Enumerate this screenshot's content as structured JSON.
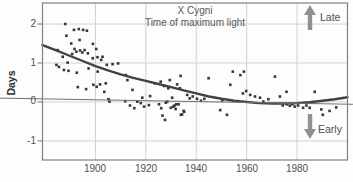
{
  "figure": {
    "title_line1": "X Cygni",
    "title_line2": "Time of maximum light",
    "y_axis_label": "Days",
    "late_label": "Late",
    "early_label": "Early"
  },
  "colors": {
    "curve": "#3f4244",
    "points": "#33373a",
    "grid": "#cfd2d4",
    "border": "#7d8184",
    "zero_line": "#6e7275",
    "arrow": "#8d9195",
    "text": "#4c5053"
  },
  "chart_data": {
    "type": "scatter",
    "title": "X Cygni",
    "subtitle": "Time of maximum light",
    "xlabel": "",
    "ylabel": "Days",
    "xlim": [
      1879,
      2000
    ],
    "ylim": [
      -1.49,
      2.54
    ],
    "grid": true,
    "x_ticks": [
      1900,
      1920,
      1940,
      1960,
      1980
    ],
    "x_tick_labels": [
      "1900",
      "1920",
      "1940",
      "1960",
      "1980"
    ],
    "y_ticks": [
      2,
      1,
      0,
      -1
    ],
    "y_tick_labels": [
      "2",
      "1",
      "0",
      "-1"
    ],
    "annotations": [
      {
        "text": "Late",
        "direction": "up",
        "meaning": "points above zero are late maxima"
      },
      {
        "text": "Early",
        "direction": "down",
        "meaning": "points below zero are early maxima"
      }
    ],
    "series": [
      {
        "name": "observed-maxima",
        "type": "scatter",
        "points": [
          [
            1884.5,
            0.95
          ],
          [
            1885.0,
            1.33
          ],
          [
            1885.5,
            0.9
          ],
          [
            1887.0,
            1.16
          ],
          [
            1887.5,
            0.82
          ],
          [
            1888.0,
            2.0
          ],
          [
            1888.5,
            1.7
          ],
          [
            1889.0,
            1.01
          ],
          [
            1889.3,
            0.8
          ],
          [
            1890.4,
            1.5
          ],
          [
            1890.8,
            1.23
          ],
          [
            1891.5,
            1.85
          ],
          [
            1891.7,
            1.36
          ],
          [
            1892.4,
            1.29
          ],
          [
            1892.6,
            0.75
          ],
          [
            1893.0,
            0.38
          ],
          [
            1893.4,
            1.87
          ],
          [
            1893.7,
            1.59
          ],
          [
            1893.9,
            1.32
          ],
          [
            1894.8,
            1.27
          ],
          [
            1895.1,
            1.85
          ],
          [
            1895.7,
            1.33
          ],
          [
            1896.3,
            0.33
          ],
          [
            1896.6,
            1.83
          ],
          [
            1897.0,
            1.25
          ],
          [
            1897.3,
            0.86
          ],
          [
            1898.9,
            1.12
          ],
          [
            1899.0,
            1.49
          ],
          [
            1899.2,
            0.44
          ],
          [
            1900.3,
            1.36
          ],
          [
            1900.5,
            0.39
          ],
          [
            1900.8,
            1.15
          ],
          [
            1900.9,
            0.78
          ],
          [
            1901.8,
            0.45
          ],
          [
            1902.3,
            1.08
          ],
          [
            1902.8,
            1.16
          ],
          [
            1903.5,
            0.26
          ],
          [
            1904.1,
            0.48
          ],
          [
            1904.5,
            0.95
          ],
          [
            1905.2,
            0.07
          ],
          [
            1905.6,
            0.01
          ],
          [
            1906.8,
            0.97
          ],
          [
            1909.0,
            0.99
          ],
          [
            1911.8,
            0.02
          ],
          [
            1912.1,
            0.69
          ],
          [
            1912.7,
            0.56
          ],
          [
            1913.7,
            -0.09
          ],
          [
            1914.7,
            0.31
          ],
          [
            1915.4,
            -0.16
          ],
          [
            1916.6,
            0.01
          ],
          [
            1918.0,
            -0.03
          ],
          [
            1918.6,
            0.11
          ],
          [
            1919.3,
            -0.12
          ],
          [
            1921.2,
            -0.08
          ],
          [
            1921.7,
            0.15
          ],
          [
            1923.5,
            0.48
          ],
          [
            1925.2,
            -0.06
          ],
          [
            1925.9,
            0.52
          ],
          [
            1926.1,
            -0.16
          ],
          [
            1926.6,
            -0.35
          ],
          [
            1927.2,
            0.41
          ],
          [
            1927.6,
            -0.46
          ],
          [
            1927.9,
            -0.02
          ],
          [
            1928.5,
            0.01
          ],
          [
            1928.9,
            0.35
          ],
          [
            1929.5,
            0.56
          ],
          [
            1929.9,
            -0.15
          ],
          [
            1930.4,
            0.11
          ],
          [
            1930.9,
            -0.12
          ],
          [
            1931.4,
            -0.09
          ],
          [
            1931.8,
            -0.18
          ],
          [
            1932.1,
            -0.06
          ],
          [
            1932.4,
            0.45
          ],
          [
            1933.0,
            -0.06
          ],
          [
            1933.5,
            0.35
          ],
          [
            1933.8,
            0.67
          ],
          [
            1933.9,
            -0.33
          ],
          [
            1934.4,
            -0.32
          ],
          [
            1935.0,
            -0.23
          ],
          [
            1935.2,
            -0.25
          ],
          [
            1936.4,
            0.18
          ],
          [
            1937.4,
            0.09
          ],
          [
            1938.6,
            0.14
          ],
          [
            1940.3,
            0.08
          ],
          [
            1941.9,
            0.03
          ],
          [
            1943.2,
            0.08
          ],
          [
            1944.9,
            0.61
          ],
          [
            1949.5,
            -0.21
          ],
          [
            1950.3,
            0.04
          ],
          [
            1952.2,
            -0.33
          ],
          [
            1953.5,
            0.44
          ],
          [
            1954.5,
            0.78
          ],
          [
            1957.5,
            0.69
          ],
          [
            1958.5,
            0.22
          ],
          [
            1958.9,
            0.78
          ],
          [
            1959.8,
            0.28
          ],
          [
            1961.4,
            0.18
          ],
          [
            1963.3,
            0.14
          ],
          [
            1965.3,
            0.11
          ],
          [
            1966.6,
            0.01
          ],
          [
            1968.6,
            0.07
          ],
          [
            1971.2,
            0.65
          ],
          [
            1973.2,
            0.14
          ],
          [
            1974.3,
            -0.09
          ],
          [
            1975.8,
            0.26
          ],
          [
            1975.9,
            -0.06
          ],
          [
            1977.1,
            -0.1
          ],
          [
            1978.2,
            -0.06
          ],
          [
            1979.1,
            -0.12
          ],
          [
            1980.4,
            -0.09
          ],
          [
            1982.4,
            -0.15
          ],
          [
            1983.7,
            -0.09
          ],
          [
            1985.0,
            -0.15
          ],
          [
            1987.0,
            0.26
          ],
          [
            1989.6,
            -0.19
          ],
          [
            1990.2,
            -0.33
          ],
          [
            1992.9,
            -0.23
          ],
          [
            1995.5,
            -0.14
          ]
        ]
      },
      {
        "name": "trend-curve",
        "type": "line",
        "role": "trend",
        "width": 2.4,
        "points": [
          [
            1879,
            1.46
          ],
          [
            1885,
            1.31
          ],
          [
            1890,
            1.18
          ],
          [
            1895,
            1.05
          ],
          [
            1900,
            0.92
          ],
          [
            1905,
            0.81
          ],
          [
            1910,
            0.71
          ],
          [
            1915,
            0.62
          ],
          [
            1920,
            0.54
          ],
          [
            1925,
            0.46
          ],
          [
            1930,
            0.38
          ],
          [
            1935,
            0.3
          ],
          [
            1940,
            0.22
          ],
          [
            1945,
            0.14
          ],
          [
            1950,
            0.08
          ],
          [
            1955,
            0.03
          ],
          [
            1960,
            0.0
          ],
          [
            1965,
            -0.03
          ],
          [
            1970,
            -0.04
          ],
          [
            1975,
            -0.04
          ],
          [
            1980,
            -0.03
          ],
          [
            1985,
            -0.01
          ],
          [
            1990,
            0.03
          ],
          [
            1995,
            0.07
          ],
          [
            2000,
            0.12
          ]
        ]
      },
      {
        "name": "zero-reference-line",
        "type": "line",
        "role": "reference",
        "width": 1,
        "extends_beyond_left_axis": true,
        "points": [
          [
            1862,
            0.1
          ],
          [
            2002,
            -0.06
          ]
        ]
      }
    ]
  }
}
